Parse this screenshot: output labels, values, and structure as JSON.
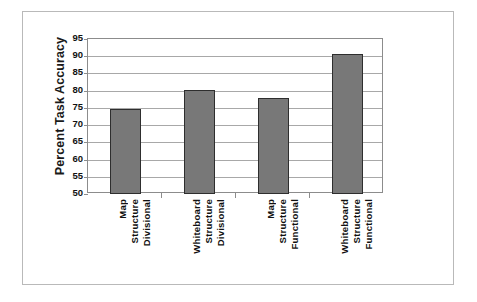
{
  "chart_data": {
    "type": "bar",
    "title": "",
    "xlabel": "",
    "ylabel": "Percent Task Accuracy",
    "ylim": [
      50,
      95
    ],
    "ytick_step": 5,
    "grid": true,
    "legend": "none",
    "categories": [
      "Divisional Structure Map",
      "Divisional Structure Whiteboard",
      "Functional Structure Map",
      "Functional Structure Whiteboard"
    ],
    "category_lines": [
      [
        "Divisional",
        "Structure",
        "Map"
      ],
      [
        "Divisional",
        "Structure",
        "Whiteboard"
      ],
      [
        "Functional",
        "Structure",
        "Map"
      ],
      [
        "Functional",
        "Structure",
        "Whiteboard"
      ]
    ],
    "values": [
      74.6,
      80.3,
      77.8,
      90.6
    ],
    "ytick_labels": [
      "95",
      "90",
      "85",
      "80",
      "75",
      "70",
      "65",
      "60",
      "55",
      "50"
    ],
    "ytick_values": [
      95,
      90,
      85,
      80,
      75,
      70,
      65,
      60,
      55,
      50
    ],
    "bar_color": "#787878",
    "bar_edge_color": "#2e2e2e",
    "grid_color": "#a8a8a8",
    "axis_color": "#8c8c8c",
    "plot_background": "#ffffff",
    "frame_color": "#b9b9b9"
  }
}
